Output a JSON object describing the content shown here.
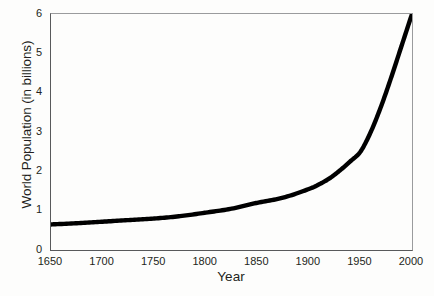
{
  "chart_data": {
    "type": "line",
    "title": "",
    "xlabel": "Year",
    "ylabel": "World Population (in billions)",
    "xlim": [
      1650,
      2000
    ],
    "ylim": [
      0,
      6
    ],
    "xticks": [
      1650,
      1700,
      1750,
      1800,
      1850,
      1900,
      1950,
      2000
    ],
    "yticks": [
      0,
      1,
      2,
      3,
      4,
      5,
      6
    ],
    "xtick_labels": [
      "1650",
      "1700",
      "1750",
      "1800",
      "1850",
      "1900",
      "1950",
      "2000"
    ],
    "ytick_labels": [
      "0",
      "1",
      "2",
      "3",
      "4",
      "5",
      "6"
    ],
    "grid": false,
    "legend": null,
    "series": [
      {
        "name": "World Population",
        "color": "#000000",
        "line_width": 4,
        "x": [
          1650,
          1675,
          1700,
          1725,
          1750,
          1775,
          1800,
          1825,
          1850,
          1875,
          1900,
          1910,
          1920,
          1930,
          1940,
          1950,
          1960,
          1970,
          1980,
          1990,
          2000
        ],
        "y": [
          0.65,
          0.68,
          0.72,
          0.76,
          0.8,
          0.86,
          0.95,
          1.05,
          1.2,
          1.33,
          1.55,
          1.67,
          1.82,
          2.02,
          2.25,
          2.5,
          3.0,
          3.65,
          4.4,
          5.2,
          6.0
        ]
      }
    ]
  }
}
